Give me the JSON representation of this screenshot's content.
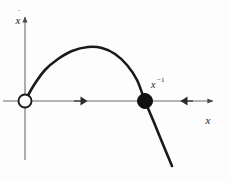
{
  "figure": {
    "background_color": "#fdfdfd",
    "ink_color": "#1a1a1a",
    "axis_color": "#8a8a8a",
    "curve_color": "#1a1a1a",
    "width": 230,
    "height": 182
  },
  "labels": {
    "y_axis": "x",
    "y_axis_dot": "˙",
    "x_axis": "x",
    "fixed_point_base": "x",
    "fixed_point_sup": "−1"
  },
  "markers": {
    "unstable_point_name": "open-circle-unstable-fixed-point",
    "stable_point_name": "filled-circle-stable-fixed-point"
  },
  "chart_data": {
    "type": "line",
    "title": "",
    "subtitle": "",
    "xlabel": "x",
    "ylabel": "ẋ",
    "grid": false,
    "legend": null,
    "axis_origin_px": {
      "x": 25,
      "y": 101
    },
    "xlim_px": [
      25,
      215
    ],
    "ylim_px": [
      15,
      160
    ],
    "annotations": [
      {
        "text": "x⁻¹",
        "at_px": {
          "x": 152,
          "y": 84
        },
        "role": "stable-fixed-point-label"
      }
    ],
    "series": [
      {
        "name": "xdot-vs-x",
        "type": "line",
        "comment": "Downward parabola through the origin and through the stable fixed point",
        "points_px": [
          {
            "x": 25,
            "y": 101
          },
          {
            "x": 34,
            "y": 85
          },
          {
            "x": 45,
            "y": 70
          },
          {
            "x": 58,
            "y": 59
          },
          {
            "x": 72,
            "y": 51
          },
          {
            "x": 88,
            "y": 47
          },
          {
            "x": 102,
            "y": 48
          },
          {
            "x": 115,
            "y": 54
          },
          {
            "x": 127,
            "y": 65
          },
          {
            "x": 137,
            "y": 80
          },
          {
            "x": 145,
            "y": 101
          },
          {
            "x": 153,
            "y": 120
          },
          {
            "x": 162,
            "y": 142
          },
          {
            "x": 172,
            "y": 166
          }
        ]
      }
    ],
    "fixed_points": [
      {
        "label": "",
        "x_px": 25,
        "y_px": 101,
        "marker": "open-circle",
        "stability": "unstable",
        "radius_px": 6.5
      },
      {
        "label": "x⁻¹",
        "x_px": 145,
        "y_px": 101,
        "marker": "filled-circle",
        "stability": "stable",
        "radius_px": 7.5
      }
    ],
    "flow_arrows": [
      {
        "x_px": 80,
        "y_px": 101,
        "direction": "right"
      },
      {
        "x_px": 186,
        "y_px": 101,
        "direction": "left"
      }
    ]
  }
}
